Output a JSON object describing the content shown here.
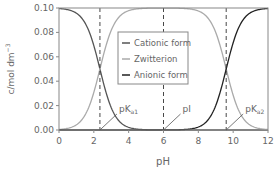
{
  "chart_data": {
    "type": "line",
    "title": "",
    "xlabel": "pH",
    "ylabel": "c/mol dm",
    "ylabel_sup": "−3",
    "xlim": [
      0,
      12
    ],
    "ylim": [
      0,
      0.1
    ],
    "xticks": [
      0,
      2,
      4,
      6,
      8,
      10,
      12
    ],
    "xtick_labels": [
      "0",
      "2",
      "4",
      "6",
      "8",
      "10",
      "12"
    ],
    "yticks": [
      0,
      0.02,
      0.04,
      0.06,
      0.08,
      0.1
    ],
    "ytick_labels": [
      "0.00",
      "0.02",
      "0.04",
      "0.06",
      "0.08",
      "0.10"
    ],
    "total_concentration": 0.1,
    "pKa1": 2.35,
    "pKa2": 9.6,
    "pI": 6.0,
    "series": [
      {
        "name": "Cationic form",
        "color": "#555555"
      },
      {
        "name": "Zwitterion",
        "color": "#aaaaaa"
      },
      {
        "name": "Anionic form",
        "color": "#222222"
      }
    ],
    "legend_position": "center",
    "annotations": [
      {
        "label_main": "pK",
        "label_sub": "a1",
        "x": 2.35
      },
      {
        "label_main": "pI",
        "label_sub": "",
        "x": 6.0
      },
      {
        "label_main": "pK",
        "label_sub": "a2",
        "x": 9.6
      }
    ],
    "grid": false
  }
}
